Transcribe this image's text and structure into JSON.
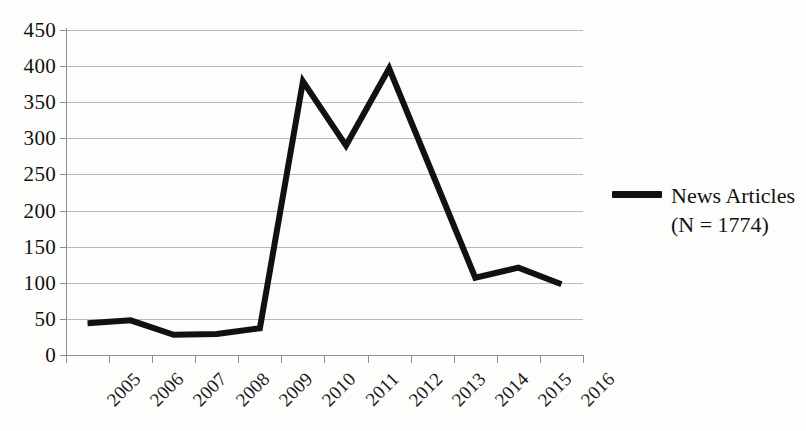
{
  "chart_data": {
    "type": "line",
    "title": "",
    "xlabel": "",
    "ylabel": "",
    "categories": [
      "2005",
      "2006",
      "2007",
      "2008",
      "2009",
      "2010",
      "2011",
      "2012",
      "2013",
      "2014",
      "2015",
      "2016"
    ],
    "values": [
      44,
      48,
      28,
      29,
      37,
      379,
      290,
      397,
      252,
      107,
      121,
      98
    ],
    "series": [
      {
        "name": "News Articles",
        "values": [
          44,
          48,
          28,
          29,
          37,
          379,
          290,
          397,
          252,
          107,
          121,
          98
        ],
        "color": "#111111",
        "line_width": 6
      }
    ],
    "ylim": [
      0,
      450
    ],
    "y_ticks": [
      0,
      50,
      100,
      150,
      200,
      250,
      300,
      350,
      400,
      450
    ],
    "y_tick_labels": [
      "0",
      "50",
      "100",
      "150",
      "200",
      "250",
      "300",
      "350",
      "400",
      "450"
    ],
    "grid": true,
    "grid_axis": "y",
    "grid_color": "#b9b9bd",
    "legend_position": "right",
    "x_tick_label_rotation": -45
  },
  "legend": {
    "entries": [
      {
        "swatch_name": "news-articles-line-swatch",
        "label_line_1": "News Articles",
        "label_line_2": "(N = 1774)",
        "color": "#111111"
      }
    ]
  },
  "axes": {
    "x_tick_labels": [
      "2005",
      "2006",
      "2007",
      "2008",
      "2009",
      "2010",
      "2011",
      "2012",
      "2013",
      "2014",
      "2015",
      "2016"
    ],
    "y_tick_labels": [
      "450",
      "400",
      "350",
      "300",
      "250",
      "200",
      "150",
      "100",
      "50",
      "0"
    ]
  },
  "colors": {
    "series": "#111111",
    "gridline": "#b9b9bd",
    "axis": "#8d8d92",
    "background": "#fdfdfb",
    "text": "#111111"
  }
}
